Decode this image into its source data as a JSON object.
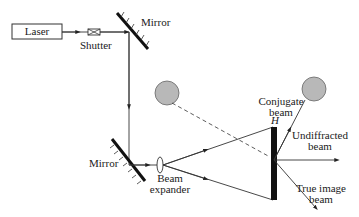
{
  "diagram": {
    "type": "optical-setup"
  },
  "components": {
    "laser": {
      "label": "Laser"
    },
    "shutter": {
      "label": "Shutter"
    },
    "mirror_top": {
      "label": "Mirror"
    },
    "mirror_bottom": {
      "label": "Mirror"
    },
    "beam_expander": {
      "label_line1": "Beam",
      "label_line2": "expander"
    },
    "hologram": {
      "label": "H"
    }
  },
  "beams": {
    "conjugate": {
      "label_line1": "Conjugate",
      "label_line2": "beam"
    },
    "undiffracted": {
      "label_line1": "Undiffracted",
      "label_line2": "beam"
    },
    "true_image": {
      "label_line1": "True image",
      "label_line2": "beam"
    }
  },
  "colors": {
    "line": "#333333",
    "mirror": "#111111",
    "object_fill": "#b8b8b8",
    "object_stroke": "#666666"
  }
}
